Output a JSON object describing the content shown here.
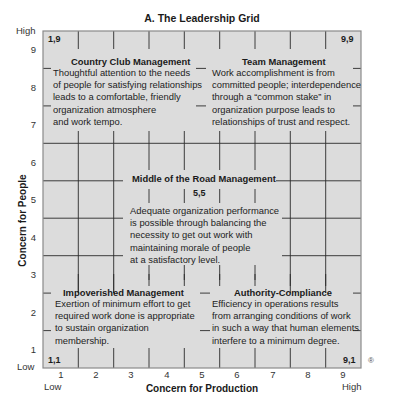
{
  "title": "A. The Leadership Grid",
  "y_axis": {
    "label": "Concern for People",
    "low_label": "Low",
    "high_label": "High",
    "ticks": [
      "9",
      "8",
      "7",
      "6",
      "5",
      "4",
      "3",
      "2",
      "1"
    ]
  },
  "x_axis": {
    "label": "Concern for Production",
    "low_label": "Low",
    "high_label": "High",
    "ticks": [
      "1",
      "2",
      "3",
      "4",
      "5",
      "6",
      "7",
      "8",
      "9"
    ]
  },
  "corners": {
    "top_left": "1,9",
    "top_right": "9,9",
    "bottom_left": "1,1",
    "bottom_right": "9,1",
    "center": "5,5"
  },
  "styles": {
    "country_club": {
      "title": "Country Club Management",
      "lines": [
        "Thoughtful attention to the needs",
        "of people for satisfying relationships",
        "leads to a comfortable, friendly",
        "organization atmosphere",
        "and work tempo."
      ]
    },
    "team": {
      "title": "Team Management",
      "lines": [
        "Work accomplishment is from",
        "committed people; interdependence",
        "through a “common stake” in",
        "organization purpose leads to",
        "relationships of trust and respect."
      ]
    },
    "middle_of_road": {
      "title": "Middle of the Road Management",
      "lines": [
        "Adequate organization performance",
        "is possible through balancing the",
        "necessity to get out work with",
        "maintaining morale of people",
        "at a satisfactory level."
      ]
    },
    "impoverished": {
      "title": "Impoverished Management",
      "lines": [
        "Exertion of minimum effort to get",
        "required work done is appropriate",
        "to sustain organization",
        "membership."
      ]
    },
    "authority_compliance": {
      "title": "Authority-Compliance",
      "lines": [
        "Efficiency in operations results",
        "from arranging conditions of work",
        "in such a way that human elements",
        "interfere to a minimum degree."
      ]
    }
  },
  "registered_mark": "®",
  "colors": {
    "grid_fill": "#dcdcdc",
    "grid_line": "#2a2a2a",
    "border": "#8a8a8a"
  }
}
